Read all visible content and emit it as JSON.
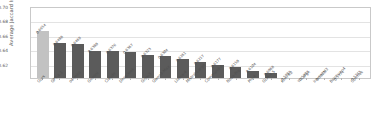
{
  "chart_data": {
    "type": "bar",
    "title": "",
    "xlabel": "",
    "ylabel": "Average Jaccard Index",
    "ylim": [
      0.6,
      0.7
    ],
    "yticks": [
      "0.70",
      "0.68",
      "0.66",
      "0.64",
      "0.62"
    ],
    "grid": true,
    "legend_position": "none",
    "highlight_index": 0,
    "highlight_color": "#c2c2c2",
    "bar_color": "#5b5b5b",
    "categories": [
      "Ours",
      "GPT-4.1",
      "o4-mini",
      "Gemini",
      "Claude",
      "DeepSeek",
      "Grok-3",
      "Qwen3-Max",
      "Llama-4",
      "Mistral-Large",
      "Command-A",
      "Nova-Pro",
      "Phi-4",
      "GLM-4.5",
      "Kimi-K2",
      "Yi-Large",
      "InternLM3",
      "Baichuan4",
      "Cosmos"
    ],
    "values": [
      0.6654,
      0.6488,
      0.6469,
      0.638,
      0.6376,
      0.6367,
      0.6323,
      0.6304,
      0.6261,
      0.6217,
      0.6177,
      0.615,
      0.6104,
      0.6068,
      0.5982,
      0.5897,
      0.5875,
      0.5774,
      0.5743
    ],
    "value_labels": [
      "0.6654",
      "0.6488",
      "0.6469",
      "0.6380",
      "0.6376",
      "0.6367",
      "0.6323",
      "0.6304",
      "0.6261",
      "0.6217",
      "0.6177",
      "0.6150",
      "0.6104",
      "0.6068",
      "0.5982",
      "0.5897",
      "0.5875",
      "0.5774",
      "0.5743"
    ]
  }
}
